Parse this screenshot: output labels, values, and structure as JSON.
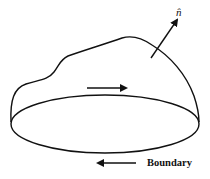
{
  "diagram": {
    "type": "surface-with-boundary",
    "normal_label": "n̂",
    "boundary_label": "Boundary",
    "colors": {
      "stroke": "#111111",
      "background": "#ffffff"
    },
    "arrows": [
      {
        "name": "circulation-arrow-top",
        "direction": "right"
      },
      {
        "name": "circulation-arrow-bottom",
        "direction": "left"
      },
      {
        "name": "normal-vector-arrow",
        "direction": "up-right"
      }
    ]
  }
}
